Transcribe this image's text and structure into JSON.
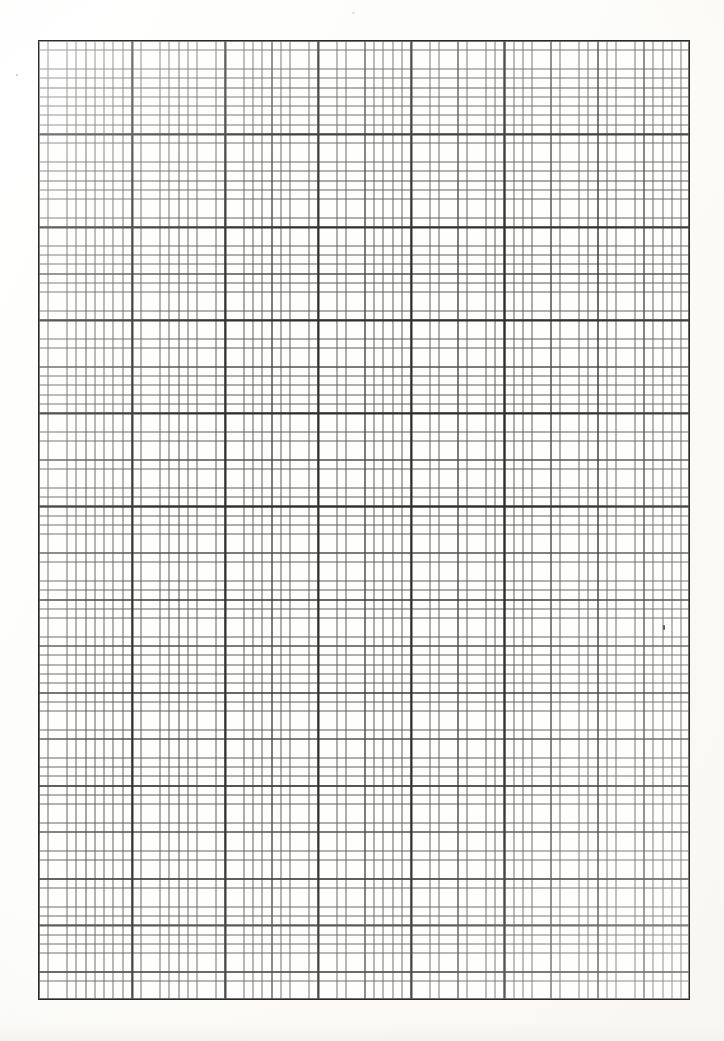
{
  "document": {
    "kind": "graph-paper-scan",
    "title": "Blank graph paper sheet",
    "page_width_px": 724,
    "page_height_px": 1041,
    "paper_color": "#fdfdfc",
    "margin_note": "",
    "visible_text": ""
  },
  "grid": {
    "label": "",
    "left_px": 38,
    "top_px": 40,
    "width_px": 652,
    "height_px": 960,
    "minor_cell_px": 9.31,
    "medium_every_cells": 5,
    "major_every_cells": 10,
    "columns_minor": 70,
    "rows_minor": 103,
    "columns_major": 7,
    "rows_major": 10,
    "minor_line_color": "#5e5e5e",
    "medium_line_color": "#4a4a4a",
    "major_line_color": "#2f2f2f",
    "border_color": "#2b2b2b",
    "border_width_px": 1.6,
    "cell_fill_color": "#fefefd"
  },
  "marks": {
    "right_margin_speck": "",
    "left_margin_speck": "",
    "top_margin_speck": ""
  },
  "chart_data": {
    "type": "table",
    "title": "",
    "xlabel": "",
    "ylabel": "",
    "categories": [],
    "values": [],
    "grid": true,
    "legend": "none",
    "note": "Empty engineering graph paper - no plotted data, no axis tick labels, no legend."
  }
}
